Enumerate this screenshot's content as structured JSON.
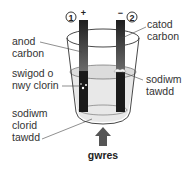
{
  "diagram": {
    "electrodes": [
      {
        "number": "1",
        "sign": "+",
        "label_lines": [
          "anod",
          "carbon"
        ]
      },
      {
        "number": "2",
        "sign": "−",
        "label_lines": [
          "catod",
          "carbon"
        ]
      }
    ],
    "labels": {
      "chlorine": [
        "swigod o",
        "nwy clorin"
      ],
      "sodium": [
        "sodiwm",
        "tawdd"
      ],
      "electrolyte": [
        "sodiwm",
        "clorid",
        "tawdd"
      ],
      "heat": "gwres"
    },
    "colors": {
      "electrode_dark": "#1a1a1a",
      "electrode_light": "#6e6e6e",
      "liquid": "#e6e6e6",
      "arrow": "#555555",
      "outline": "#333333"
    }
  }
}
